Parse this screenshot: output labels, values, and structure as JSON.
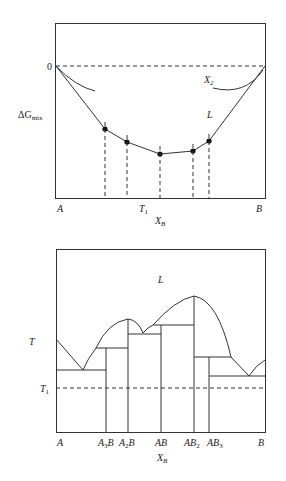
{
  "top_panel": {
    "zero_label": "0",
    "y_label": "ΔG",
    "y_label_sub": "mix",
    "x_left_label": "A",
    "x_right_label": "B",
    "temperature_label": "T",
    "temperature_sub": "1",
    "x_axis_label": "X",
    "x_axis_sub": "B",
    "curve_right_label": "X",
    "curve_right_sub": "2",
    "liquid_label": "L",
    "hull_points_count": 5
  },
  "bottom_panel": {
    "y_label": "T",
    "t1_label": "T",
    "t1_sub": "1",
    "liquid_label": "L",
    "x_axis_label": "X",
    "x_axis_sub": "B",
    "compounds": [
      {
        "main": "A",
        "sub": ""
      },
      {
        "main": "A",
        "sub": "3",
        "tail": "B"
      },
      {
        "main": "A",
        "sub": "2",
        "tail": "B"
      },
      {
        "main": "AB",
        "sub": ""
      },
      {
        "main": "AB",
        "sub": "2"
      },
      {
        "main": "AB",
        "sub": "3"
      },
      {
        "main": "B",
        "sub": ""
      }
    ]
  }
}
